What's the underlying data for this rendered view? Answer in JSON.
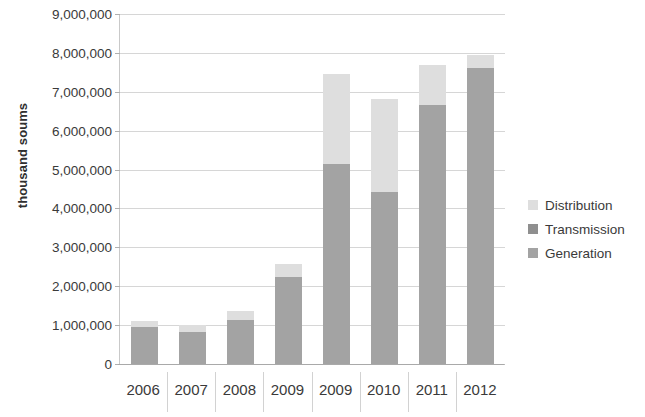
{
  "chart_data": {
    "type": "bar",
    "stacked": true,
    "title": "",
    "xlabel": "",
    "ylabel": "thousand soums",
    "ylim": [
      0,
      9000000
    ],
    "ytick_step": 1000000,
    "grid": true,
    "legend_position": "right",
    "categories": [
      "2006",
      "2007",
      "2008",
      "2009",
      "2009",
      "2010",
      "2011",
      "2012"
    ],
    "ytick_labels": [
      "9,000,000",
      "8,000,000",
      "7,000,000",
      "6,000,000",
      "5,000,000",
      "4,000,000",
      "3,000,000",
      "2,000,000",
      "1,000,000",
      "0"
    ],
    "ytick_values": [
      9000000,
      8000000,
      7000000,
      6000000,
      5000000,
      4000000,
      3000000,
      2000000,
      1000000,
      0
    ],
    "series": [
      {
        "name": "Generation",
        "color": "#a3a3a3",
        "values": [
          950000,
          820000,
          1130000,
          2230000,
          5150000,
          4420000,
          6650000,
          7600000
        ]
      },
      {
        "name": "Transmission",
        "color": "#8f8f8f",
        "values": [
          0,
          0,
          0,
          0,
          0,
          0,
          0,
          0
        ]
      },
      {
        "name": "Distribution",
        "color": "#dedede",
        "values": [
          150000,
          180000,
          240000,
          340000,
          2300000,
          2400000,
          1030000,
          350000
        ]
      }
    ],
    "totals": [
      1100000,
      1000000,
      1370000,
      2570000,
      7450000,
      6820000,
      7680000,
      7950000
    ]
  },
  "legend": {
    "items": [
      {
        "label": "Distribution",
        "color": "#dedede"
      },
      {
        "label": "Transmission",
        "color": "#8f8f8f"
      },
      {
        "label": "Generation",
        "color": "#a3a3a3"
      }
    ]
  }
}
